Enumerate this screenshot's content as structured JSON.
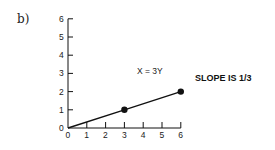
{
  "panel_label": "b)",
  "chart_data": {
    "type": "line",
    "title": "",
    "xlabel": "",
    "ylabel": "",
    "xlim": [
      0,
      6
    ],
    "ylim": [
      0,
      6
    ],
    "x_ticks": [
      "0",
      "1",
      "2",
      "3",
      "4",
      "5",
      "6"
    ],
    "y_ticks": [
      "0",
      "1",
      "2",
      "3",
      "4",
      "5",
      "6"
    ],
    "grid": false,
    "series": [
      {
        "name": "X = 3Y",
        "x": [
          0,
          3,
          6
        ],
        "y": [
          0,
          1,
          2
        ],
        "markers": [
          [
            3,
            1
          ],
          [
            6,
            2
          ]
        ]
      }
    ],
    "annotations": [
      {
        "text": "X = 3Y",
        "x": 4,
        "y": 3.2
      },
      {
        "text": "SLOPE IS 1/3",
        "position": "right"
      }
    ]
  },
  "annotations": {
    "equation": "X = 3Y",
    "slope": "SLOPE IS 1/3"
  },
  "colors": {
    "line": "#111111",
    "text": "#222222"
  }
}
